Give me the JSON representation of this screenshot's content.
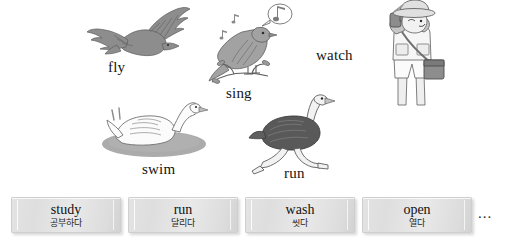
{
  "page": {
    "background_color": "#ffffff",
    "width": 506,
    "height": 246
  },
  "illustrations": [
    {
      "id": "fly",
      "label": "fly",
      "icon": "flying-bird-icon",
      "description": "gray eagle with spread wings in flight",
      "color": "#8e8e8e"
    },
    {
      "id": "sing",
      "label": "sing",
      "icon": "singing-bird-icon",
      "description": "bird perched on a branch with music note speech bubble",
      "color": "#9a9a9a"
    },
    {
      "id": "watch",
      "label": "watch",
      "icon": "birdwatcher-icon",
      "description": "person in safari hat looking through binoculars with shoulder bag",
      "color": "#b6b6b6"
    },
    {
      "id": "swim",
      "label": "swim",
      "icon": "swan-icon",
      "description": "white swan floating on gray water",
      "color": "#f4f4f4"
    },
    {
      "id": "run",
      "label": "run",
      "icon": "ostrich-icon",
      "description": "ostrich running",
      "color": "#6f6f6f"
    }
  ],
  "word_cards": [
    {
      "english": "study",
      "korean": "공부하다"
    },
    {
      "english": "run",
      "korean": "달리다"
    },
    {
      "english": "wash",
      "korean": "씻다"
    },
    {
      "english": "open",
      "korean": "열다"
    }
  ],
  "overflow_indicator": "..."
}
